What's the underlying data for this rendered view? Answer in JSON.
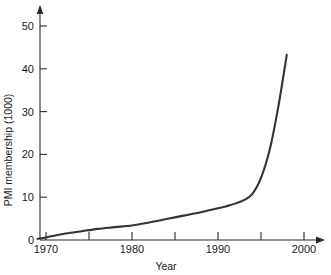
{
  "chart_data": {
    "type": "line",
    "title": "",
    "xlabel": "Year",
    "ylabel": "PMI membership (1000)",
    "xlim": [
      1968.5,
      2002
    ],
    "ylim": [
      0,
      52
    ],
    "grid": false,
    "legend": "none",
    "xticks": [
      1970,
      1980,
      1990,
      2000
    ],
    "xtick_labels": [
      "1970",
      "1980",
      "1990",
      "2000"
    ],
    "xminor_ticks": [
      1975,
      1985,
      1995
    ],
    "yticks": [
      0,
      10,
      20,
      30,
      40,
      50
    ],
    "ytick_labels": [
      "0",
      "10",
      "20",
      "30",
      "40",
      "50"
    ],
    "series": [
      {
        "name": "PMI membership",
        "color": "#333333",
        "x": [
          1969,
          1970,
          1972,
          1974,
          1976,
          1978,
          1980,
          1982,
          1984,
          1986,
          1988,
          1990,
          1991,
          1992,
          1993,
          1994,
          1995,
          1996,
          1997,
          1998
        ],
        "values": [
          0.3,
          0.6,
          1.4,
          2.0,
          2.6,
          3.0,
          3.4,
          4.1,
          4.9,
          5.7,
          6.5,
          7.4,
          7.9,
          8.5,
          9.3,
          10.8,
          14.5,
          21.0,
          31.0,
          43.3
        ]
      }
    ],
    "ticks": {
      "x_axis_tick_labels": [
        "1970",
        "1980",
        "1990",
        "2000"
      ],
      "y_axis_tick_labels": [
        "0",
        "10",
        "20",
        "30",
        "40",
        "50"
      ]
    }
  },
  "labels": {
    "y0": "0",
    "y10": "10",
    "y20": "20",
    "y30": "30",
    "y40": "40",
    "y50": "50",
    "x1970": "1970",
    "x1980": "1980",
    "x1990": "1990",
    "x2000": "2000",
    "x_title": "Year",
    "y_title": "PMI membership (1000)"
  },
  "style": {
    "curve_color": "#333333",
    "axis_color": "#2b2b2b",
    "background": "#ffffff"
  }
}
